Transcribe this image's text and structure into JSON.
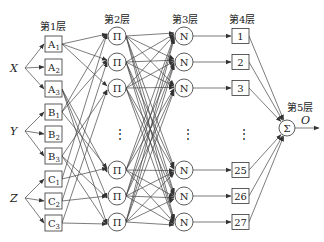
{
  "diagram": {
    "type": "ANFIS network structure",
    "layers": [
      {
        "label": "第1层"
      },
      {
        "label": "第2层"
      },
      {
        "label": "第3层"
      },
      {
        "label": "第4层"
      },
      {
        "label": "第5层"
      }
    ],
    "inputs": [
      "X",
      "Y",
      "Z"
    ],
    "layer1_nodes": [
      {
        "base": "A",
        "sub": "1"
      },
      {
        "base": "A",
        "sub": "2"
      },
      {
        "base": "A",
        "sub": "3"
      },
      {
        "base": "B",
        "sub": "1"
      },
      {
        "base": "B",
        "sub": "2"
      },
      {
        "base": "B",
        "sub": "3"
      },
      {
        "base": "C",
        "sub": "1"
      },
      {
        "base": "C",
        "sub": "2"
      },
      {
        "base": "C",
        "sub": "3"
      }
    ],
    "layer2_symbol": "Π",
    "layer3_symbol": "N",
    "layer4_nodes": [
      "1",
      "2",
      "3",
      "25",
      "26",
      "27"
    ],
    "layer5_symbol": "Σ",
    "output": "O",
    "ellipsis": "⋮"
  }
}
